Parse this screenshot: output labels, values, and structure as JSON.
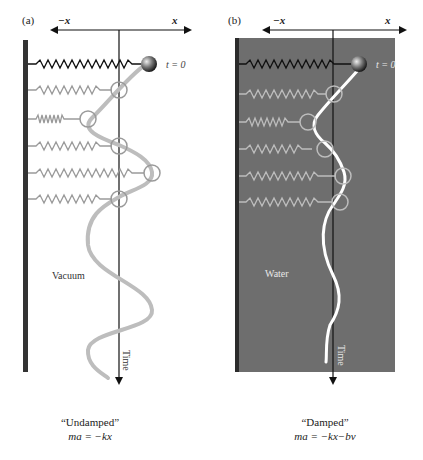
{
  "panels": [
    {
      "id": "a",
      "label": "(a)",
      "axis_neg": "−x",
      "axis_pos": "x",
      "t0_label": "t = 0",
      "medium": "Vacuum",
      "time_label": "Time",
      "caption_title": "“Undamped”",
      "caption_eq": "ma = −kx",
      "background": "#ffffff"
    },
    {
      "id": "b",
      "label": "(b)",
      "axis_neg": "−x",
      "axis_pos": "x",
      "t0_label": "t = 0",
      "medium": "Water",
      "time_label": "Time",
      "caption_title": "“Damped”",
      "caption_eq": "ma = −kx−bv",
      "background": "#6e6e6e"
    }
  ],
  "colors": {
    "wall": "#333333",
    "spring_active": "#111111",
    "spring_faded": "#9a9a9a",
    "trajectory_undamped": "#bdbdbd",
    "trajectory_damped": "#ffffff",
    "water": "#6e6e6e"
  }
}
